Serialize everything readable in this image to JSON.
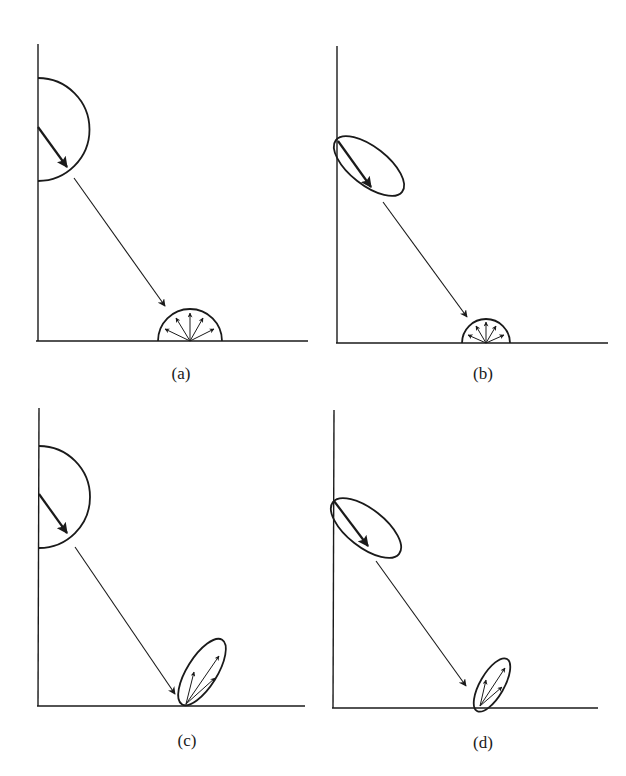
{
  "figure": {
    "ink_color": "#1a1a1a",
    "background": "#ffffff",
    "panels": [
      {
        "id": "a",
        "label": "(a)",
        "source_lobe": "semicircle (diffuse)",
        "reflection_lobe": "semicircle (diffuse)"
      },
      {
        "id": "b",
        "label": "(b)",
        "source_lobe": "tilted ellipse (directional)",
        "reflection_lobe": "semicircle (diffuse)"
      },
      {
        "id": "c",
        "label": "(c)",
        "source_lobe": "semicircle (diffuse)",
        "reflection_lobe": "tilted ellipse (specular)"
      },
      {
        "id": "d",
        "label": "(d)",
        "source_lobe": "tilted ellipse (directional)",
        "reflection_lobe": "tilted ellipse (specular)"
      }
    ]
  }
}
